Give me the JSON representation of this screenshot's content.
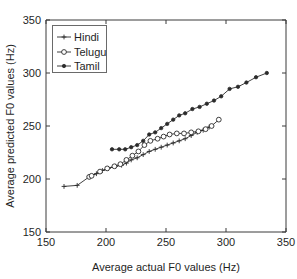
{
  "chart_data": {
    "type": "line",
    "title": "",
    "xlabel": "Average actual F0 values (Hz)",
    "ylabel": "Average predicted F0 values (Hz)",
    "xlim": [
      150,
      350
    ],
    "ylim": [
      150,
      350
    ],
    "xticks": [
      150,
      200,
      250,
      300,
      350
    ],
    "yticks": [
      150,
      200,
      250,
      300,
      350
    ],
    "xtick_labels": [
      "150",
      "200",
      "250",
      "300",
      "350"
    ],
    "ytick_labels": [
      "150",
      "200",
      "250",
      "300",
      "350"
    ],
    "grid": false,
    "legend_position": "upper-left",
    "series": [
      {
        "name": "Hindi",
        "marker": "plus",
        "x": [
          165,
          176,
          186,
          192,
          197,
          202,
          208,
          213,
          217,
          221,
          226,
          231,
          236,
          241,
          246,
          251,
          256,
          261,
          266,
          271,
          276,
          281,
          286
        ],
        "y": [
          193,
          194,
          202,
          205,
          208,
          210,
          212,
          213,
          215,
          218,
          220,
          223,
          226,
          228,
          230,
          232,
          234,
          236,
          238,
          241,
          244,
          246,
          249
        ]
      },
      {
        "name": "Telugu",
        "marker": "circle",
        "x": [
          186,
          188,
          195,
          201,
          207,
          212,
          217,
          222,
          227,
          232,
          237,
          243,
          248,
          253,
          259,
          265,
          271,
          277,
          283,
          288,
          294
        ],
        "y": [
          202,
          203,
          207,
          210,
          212,
          214,
          218,
          222,
          226,
          232,
          236,
          238,
          240,
          242,
          243,
          243,
          244,
          245,
          247,
          250,
          256
        ]
      },
      {
        "name": "Tamil",
        "marker": "filled",
        "x": [
          205,
          211,
          216,
          221,
          226,
          231,
          236,
          241,
          246,
          251,
          256,
          261,
          266,
          272,
          278,
          284,
          290,
          296,
          303,
          310,
          317,
          325,
          334
        ],
        "y": [
          228,
          228,
          228,
          230,
          232,
          236,
          242,
          244,
          248,
          252,
          256,
          260,
          262,
          266,
          268,
          271,
          274,
          278,
          285,
          287,
          291,
          296,
          300
        ]
      }
    ],
    "legend_entries": [
      "Hindi",
      "Telugu",
      "Tamil"
    ]
  },
  "figure": {
    "background": "#ffffff",
    "axis_color": "#3a3a3a",
    "line_color": "#2b2b2b"
  }
}
